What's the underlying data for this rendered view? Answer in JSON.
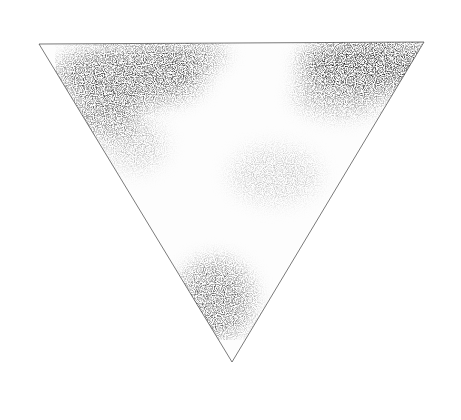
{
  "image": {
    "subject": "inverted-triangle-ink-print",
    "background_color": "#ffffff",
    "ink_color": "#111111",
    "triangle": {
      "vertices": [
        [
          39,
          44
        ],
        [
          424,
          42
        ],
        [
          232,
          362
        ]
      ]
    },
    "dark_regions": [
      {
        "name": "top-left-cloud",
        "cx": 130,
        "cy": 75,
        "rx": 75,
        "ry": 30,
        "opacity": 0.85
      },
      {
        "name": "top-left-lower-patch",
        "cx": 105,
        "cy": 115,
        "rx": 35,
        "ry": 22,
        "opacity": 0.7
      },
      {
        "name": "top-left-upper-band",
        "cx": 180,
        "cy": 55,
        "rx": 45,
        "ry": 14,
        "opacity": 0.75
      },
      {
        "name": "top-right-solid",
        "cx": 370,
        "cy": 65,
        "rx": 70,
        "ry": 28,
        "opacity": 1.0
      },
      {
        "name": "top-right-fade",
        "cx": 340,
        "cy": 95,
        "rx": 45,
        "ry": 20,
        "opacity": 0.55
      },
      {
        "name": "bottom-cloud",
        "cx": 215,
        "cy": 300,
        "rx": 38,
        "ry": 40,
        "opacity": 0.75
      }
    ],
    "speckle_regions": [
      {
        "name": "center-speckle",
        "cx": 275,
        "cy": 175,
        "rx": 45,
        "ry": 28,
        "opacity": 0.25
      },
      {
        "name": "left-speckle",
        "cx": 135,
        "cy": 145,
        "rx": 30,
        "ry": 25,
        "opacity": 0.3
      }
    ]
  }
}
